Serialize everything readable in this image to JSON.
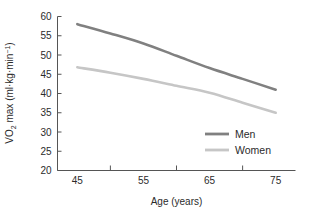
{
  "chart_data": {
    "type": "line",
    "title": "",
    "xlabel": "Age (years)",
    "ylabel": "VO2 max (ml·kg·min⁻¹)",
    "ylabel_parts": {
      "lead": "VO",
      "subscript": "2",
      "mid": " max (ml·kg·min",
      "superscript": "−1",
      "tail": ")"
    },
    "x": [
      45,
      50,
      55,
      60,
      65,
      70,
      75
    ],
    "xlim": [
      42,
      78
    ],
    "ylim": [
      20,
      60
    ],
    "xticks": [
      50,
      60,
      70
    ],
    "xtick_labels": [
      "45",
      "55",
      "65",
      "75"
    ],
    "xtick_label_values": [
      45,
      55,
      65,
      75
    ],
    "yticks": [
      20,
      25,
      30,
      35,
      40,
      45,
      50,
      55,
      60
    ],
    "ytick_labels": [
      "20",
      "25",
      "30",
      "35",
      "40",
      "45",
      "50",
      "55",
      "60"
    ],
    "grid": false,
    "legend_position": "bottom-right",
    "series": [
      {
        "name": "Men",
        "color": "#808080",
        "values": [
          58.0,
          55.6,
          53.0,
          49.8,
          46.6,
          43.8,
          41.0
        ]
      },
      {
        "name": "Women",
        "color": "#c6c6c6",
        "values": [
          46.8,
          45.4,
          43.8,
          42.0,
          40.2,
          37.6,
          35.0
        ]
      }
    ]
  },
  "legend": {
    "entries": [
      {
        "label": "Men",
        "color": "#808080"
      },
      {
        "label": "Women",
        "color": "#c6c6c6"
      }
    ]
  },
  "axes": {
    "axis_color": "#555555",
    "text_color": "#2b2b2b"
  }
}
